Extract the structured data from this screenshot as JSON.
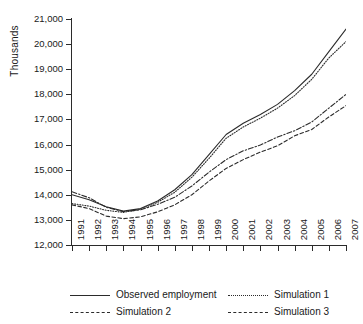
{
  "chart_data": {
    "type": "line",
    "title": "",
    "xlabel": "",
    "ylabel": "Thousands",
    "grid": false,
    "legend_position": "bottom",
    "x": [
      1991,
      1992,
      1993,
      1994,
      1995,
      1996,
      1997,
      1998,
      1999,
      2000,
      2001,
      2002,
      2003,
      2004,
      2005,
      2006,
      2007
    ],
    "categories": [
      "1991",
      "1992",
      "1993",
      "1994",
      "1995",
      "1996",
      "1997",
      "1998",
      "1999",
      "2000",
      "2001",
      "2002",
      "2003",
      "2004",
      "2005",
      "2006",
      "2007"
    ],
    "xlim": [
      1991,
      2007
    ],
    "ylim": [
      12000,
      21000
    ],
    "yticks": [
      12000,
      13000,
      14000,
      15000,
      16000,
      17000,
      18000,
      19000,
      20000,
      21000
    ],
    "ytick_labels": [
      "12,000",
      "13,000",
      "14,000",
      "15,000",
      "16,000",
      "17,000",
      "18,000",
      "19,000",
      "20,000",
      "21,000"
    ],
    "series": [
      {
        "name": "Observed employment",
        "style": "solid",
        "values": [
          14000,
          13800,
          13520,
          13350,
          13450,
          13750,
          14200,
          14800,
          15600,
          16400,
          16850,
          17200,
          17600,
          18150,
          18800,
          19700,
          20600
        ]
      },
      {
        "name": "Simulation 1",
        "style": "dotted",
        "values": [
          13650,
          13550,
          13380,
          13300,
          13420,
          13700,
          14100,
          14700,
          15450,
          16250,
          16700,
          17050,
          17450,
          17950,
          18600,
          19450,
          20100
        ]
      },
      {
        "name": "Simulation 2",
        "style": "dashdot",
        "values": [
          14120,
          13880,
          13500,
          13330,
          13400,
          13620,
          13900,
          14350,
          14900,
          15400,
          15750,
          15980,
          16300,
          16550,
          16900,
          17450,
          18000
        ]
      },
      {
        "name": "Simulation 3",
        "style": "dashed",
        "values": [
          13600,
          13450,
          13150,
          13050,
          13120,
          13320,
          13600,
          14000,
          14550,
          15050,
          15400,
          15700,
          15950,
          16350,
          16600,
          17100,
          17550
        ]
      }
    ]
  },
  "axis": {
    "ylabel": "Thousands"
  },
  "legend": {
    "items": [
      {
        "label": "Observed employment"
      },
      {
        "label": "Simulation 1"
      },
      {
        "label": "Simulation 2"
      },
      {
        "label": "Simulation 3"
      }
    ]
  },
  "colors": {
    "line": "#2b2b2b",
    "background": "#ffffff"
  }
}
